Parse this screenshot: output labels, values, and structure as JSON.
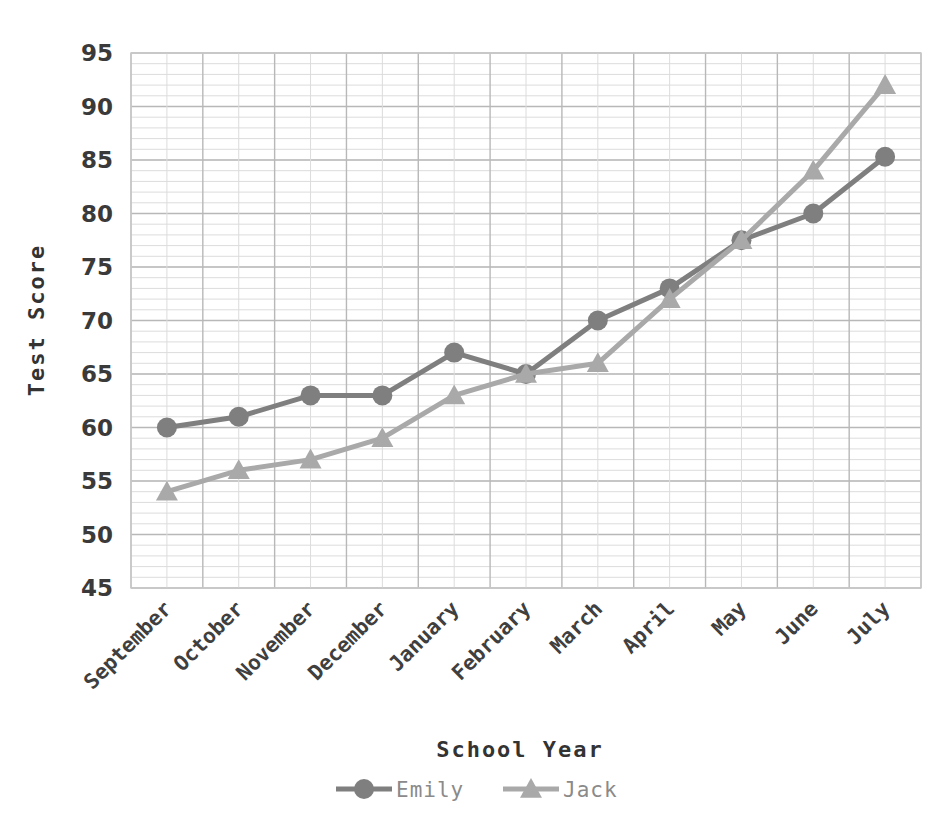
{
  "chart_data": {
    "type": "line",
    "title": "",
    "xlabel": "School Year",
    "ylabel": "Test Score",
    "categories": [
      "September",
      "October",
      "November",
      "December",
      "January",
      "February",
      "March",
      "April",
      "May",
      "June",
      "July"
    ],
    "series": [
      {
        "name": "Emily",
        "values": [
          60,
          61,
          63,
          63,
          67,
          65,
          70,
          73,
          77.5,
          80,
          85.3
        ],
        "color": "#7f7f7f",
        "marker": "circle"
      },
      {
        "name": "Jack",
        "values": [
          54,
          56,
          57,
          59,
          63,
          65,
          66,
          72,
          77.5,
          84,
          92
        ],
        "color": "#a9a9a9",
        "marker": "triangle"
      }
    ],
    "ylim": [
      45,
      95
    ],
    "ytick_labels": [
      "45",
      "50",
      "55",
      "60",
      "65",
      "70",
      "75",
      "80",
      "85",
      "90",
      "95"
    ],
    "ytick_values": [
      45,
      50,
      55,
      60,
      65,
      70,
      75,
      80,
      85,
      90,
      95
    ],
    "y_minor_step": 1,
    "grid": "both",
    "legend_position": "bottom",
    "legend_entries": [
      "Emily",
      "Jack"
    ],
    "xtick_rotation": -45
  },
  "axes": {
    "y_title": "Test Score",
    "x_title": "School Year"
  },
  "colors": {
    "emily": "#7f7f7f",
    "jack": "#a9a9a9",
    "grid_minor": "#dcdcdc",
    "grid_major": "#b8b8b8",
    "text": "#3a3a3a"
  },
  "legend": {
    "items": [
      {
        "label": "Emily",
        "marker": "circle-marker",
        "color": "#7f7f7f"
      },
      {
        "label": "Jack",
        "marker": "triangle-marker",
        "color": "#a9a9a9"
      }
    ]
  }
}
